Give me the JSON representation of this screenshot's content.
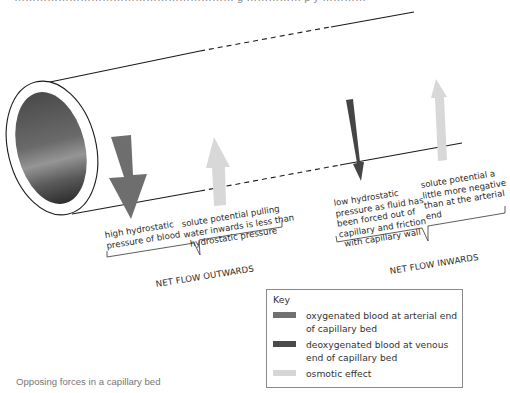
{
  "figure": {
    "top_cut_text": "…………………………………………………… g …………… p  y  …………",
    "caption": "Opposing forces in a capillary bed"
  },
  "labels": {
    "high_hydrostatic": [
      "high hydrostatic",
      "pressure of blood"
    ],
    "solute_arterial": [
      "solute potential pulling",
      "water inwards is less than",
      "hydrostatic pressure"
    ],
    "net_outwards": "NET FLOW OUTWARDS",
    "low_hydrostatic": [
      "low hydrostatic",
      "pressure as fluid has",
      "been forced out of",
      "capillary and friction",
      "with capillary wall"
    ],
    "solute_venous": [
      "solute potential a",
      "little more negative",
      "than at the arterial",
      "end"
    ],
    "net_inwards": "NET FLOW INWARDS"
  },
  "key": {
    "title": "Key",
    "items": [
      {
        "label": "oxygenated blood at arterial end of capillary bed",
        "color": "#707070"
      },
      {
        "label": "deoxygenated blood at venous end of capillary bed",
        "color": "#4a4a4a"
      },
      {
        "label": "osmotic effect",
        "color": "#d6d6d6"
      }
    ]
  },
  "colors": {
    "arterial_arrow": "#6e6e6e",
    "venous_arrow": "#454545",
    "osmotic_arrow": "#d8d8d8",
    "outline": "#1a1a1a",
    "lumen_dark": "#3a3a3a",
    "lumen_light": "#8a8a8a"
  }
}
